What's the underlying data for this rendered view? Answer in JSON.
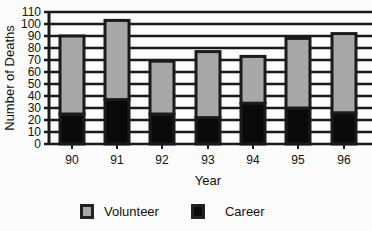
{
  "chart_data": {
    "type": "bar",
    "stacked": true,
    "title": "",
    "xlabel": "Year",
    "ylabel": "Number of Deaths",
    "categories": [
      "90",
      "91",
      "92",
      "93",
      "94",
      "95",
      "96"
    ],
    "series": [
      {
        "name": "Career",
        "color": "#0a0a0a",
        "values": [
          25,
          37,
          25,
          22,
          34,
          30,
          26
        ]
      },
      {
        "name": "Volunteer",
        "color": "#a8a8a8",
        "values": [
          65,
          66,
          44,
          55,
          39,
          58,
          66
        ]
      }
    ],
    "totals": [
      90,
      103,
      69,
      77,
      73,
      88,
      92
    ],
    "ylim": [
      0,
      110
    ],
    "yticks": [
      0,
      10,
      20,
      30,
      40,
      50,
      60,
      70,
      80,
      90,
      100,
      110
    ],
    "grid": true,
    "legend_position": "bottom"
  },
  "legend": {
    "volunteer_label": "Volunteer",
    "career_label": "Career"
  }
}
